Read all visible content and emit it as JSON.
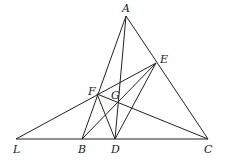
{
  "diagram": {
    "type": "geometry",
    "points": {
      "A": {
        "x": 126,
        "y": 16,
        "label": "A",
        "lx": 122,
        "ly": 12
      },
      "E": {
        "x": 156,
        "y": 63,
        "label": "E",
        "lx": 160,
        "ly": 63
      },
      "F": {
        "x": 97,
        "y": 94,
        "label": "F",
        "lx": 88,
        "ly": 95
      },
      "G": {
        "x": 118,
        "y": 102,
        "label": "G",
        "lx": 111,
        "ly": 99
      },
      "L": {
        "x": 16,
        "y": 139,
        "label": "L",
        "lx": 13,
        "ly": 153
      },
      "B": {
        "x": 82,
        "y": 139,
        "label": "B",
        "lx": 78,
        "ly": 153
      },
      "D": {
        "x": 115,
        "y": 139,
        "label": "D",
        "lx": 111,
        "ly": 153
      },
      "C": {
        "x": 208,
        "y": 139,
        "label": "C",
        "lx": 204,
        "ly": 153
      }
    },
    "segments": [
      [
        "A",
        "B"
      ],
      [
        "A",
        "C"
      ],
      [
        "A",
        "D"
      ],
      [
        "L",
        "C"
      ],
      [
        "L",
        "E"
      ],
      [
        "F",
        "C"
      ],
      [
        "F",
        "D"
      ],
      [
        "B",
        "E"
      ],
      [
        "D",
        "E"
      ]
    ]
  }
}
